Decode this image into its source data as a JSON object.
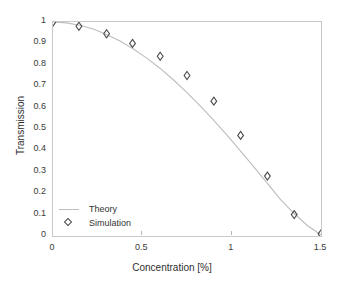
{
  "chart_data": {
    "type": "line",
    "title": "",
    "xlabel": "Concentration [%]",
    "ylabel": "Transmission",
    "xlim": [
      0,
      1.5
    ],
    "ylim": [
      0,
      1
    ],
    "grid": false,
    "legend_position": "lower-left-inside",
    "xticks": [
      0,
      0.5,
      1,
      1.5
    ],
    "xtick_labels": [
      "0",
      "0.5",
      "1",
      "1.5"
    ],
    "yticks": [
      0,
      0.1,
      0.2,
      0.3,
      0.4,
      0.5,
      0.6,
      0.7,
      0.8,
      0.9,
      1
    ],
    "ytick_labels": [
      "0",
      "0.1",
      "0.2",
      "0.3",
      "0.4",
      "0.5",
      "0.6",
      "0.7",
      "0.8",
      "0.9",
      "1"
    ],
    "series": [
      {
        "name": "Theory",
        "style": "line",
        "color": "#bdbdbd",
        "x": [
          0,
          0.075,
          0.15,
          0.225,
          0.3,
          0.375,
          0.45,
          0.525,
          0.6,
          0.675,
          0.75,
          0.825,
          0.9,
          0.975,
          1.05,
          1.125,
          1.2,
          1.275,
          1.35,
          1.425,
          1.5
        ],
        "values": [
          1.0,
          0.996,
          0.985,
          0.967,
          0.942,
          0.911,
          0.874,
          0.831,
          0.783,
          0.729,
          0.67,
          0.607,
          0.54,
          0.47,
          0.397,
          0.322,
          0.246,
          0.169,
          0.105,
          0.048,
          0.006
        ]
      },
      {
        "name": "Simulation",
        "style": "marker-diamond",
        "color": "#4a4a4a",
        "x": [
          0,
          0.145,
          0.3,
          0.445,
          0.6,
          0.75,
          0.9,
          1.05,
          1.2,
          1.35,
          1.5
        ],
        "values": [
          1.0,
          0.98,
          0.945,
          0.9,
          0.84,
          0.75,
          0.63,
          0.47,
          0.28,
          0.1,
          0.01
        ]
      }
    ]
  },
  "legend": {
    "entries": [
      {
        "label": "Theory"
      },
      {
        "label": "Simulation"
      }
    ]
  },
  "colors": {
    "line": "#bdbdbd",
    "marker": "#4a4a4a",
    "axis": "#c9c9c9",
    "text": "#2e2e2e",
    "background": "#ffffff"
  }
}
